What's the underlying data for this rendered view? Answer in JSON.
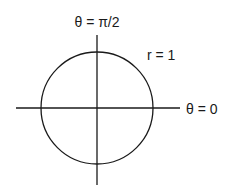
{
  "diagram": {
    "labels": {
      "vertical_axis": "θ = π/2",
      "horizontal_axis": "θ = 0",
      "radius": "r = 1"
    },
    "circle": {
      "cx": 97,
      "cy": 108,
      "r": 56,
      "stroke": "#1a1a1a"
    },
    "axes": {
      "horizontal": {
        "x1": 16,
        "y1": 108,
        "x2": 180,
        "y2": 108
      },
      "vertical": {
        "x1": 97,
        "y1": 35,
        "x2": 97,
        "y2": 185
      },
      "stroke": "#1a1a1a"
    }
  }
}
